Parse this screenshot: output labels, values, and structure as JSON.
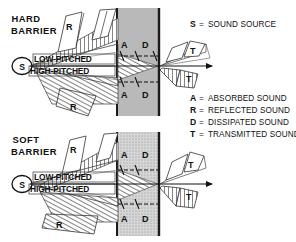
{
  "figure": {
    "background": "#ffffff",
    "ink": "#111111"
  },
  "legend": {
    "items": [
      {
        "key": "S",
        "eq": "=",
        "text": "SOUND SOURCE"
      },
      {
        "key": "A",
        "eq": "=",
        "text": "ABSORBED SOUND"
      },
      {
        "key": "R",
        "eq": "=",
        "text": "REFLECTED SOUND"
      },
      {
        "key": "D",
        "eq": "=",
        "text": "DISSIPATED SOUND"
      },
      {
        "key": "T",
        "eq": "=",
        "text": "TRANSMITTED SOUND"
      }
    ]
  },
  "panels": [
    {
      "id": "hard",
      "title_line1": "HARD",
      "title_line2": "BARRIER",
      "source_label": "S",
      "beam_labels": {
        "upper": "LOW-PITCHED",
        "lower": "HIGH-PITCHED"
      },
      "reflected_labels": [
        "R",
        "R"
      ],
      "barrier_labels": {
        "top": [
          "A",
          "D"
        ],
        "bottom": [
          "A",
          "D"
        ]
      },
      "transmitted_labels": [
        "T",
        "T"
      ],
      "barrier_fill": "#b9b9b9",
      "barrier_edge": "#1a1a1a"
    },
    {
      "id": "soft",
      "title_line1": "SOFT",
      "title_line2": "BARRIER",
      "source_label": "S",
      "beam_labels": {
        "upper": "LOW-PITCHED",
        "lower": "HIGH-PITCHED"
      },
      "reflected_labels": [
        "R",
        "R"
      ],
      "barrier_labels": {
        "top": [
          "A",
          "D"
        ],
        "bottom": [
          "A",
          "D"
        ]
      },
      "transmitted_labels": [
        "T",
        "T"
      ],
      "barrier_fill": "#cfcfcf",
      "barrier_edge": "#1a1a1a"
    }
  ]
}
